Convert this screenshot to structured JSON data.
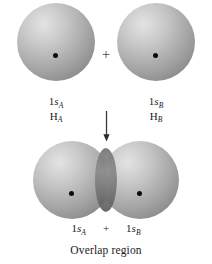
{
  "figure": {
    "background_color": "#ffffff",
    "sphere_color_light": "#e3e3e3",
    "sphere_color_dark": "#6f6f6f",
    "nucleus_color": "#0b0b0b",
    "overlap_color": "#6a6a6a"
  },
  "top_row": {
    "left_atom": {
      "orbital_prefix": "1",
      "orbital_symbol": "s",
      "orbital_subscript": "A",
      "atom_symbol": "H",
      "atom_subscript": "A",
      "nucleus_label": "nucleus"
    },
    "operator": "+",
    "right_atom": {
      "orbital_prefix": "1",
      "orbital_symbol": "s",
      "orbital_subscript": "B",
      "atom_symbol": "H",
      "atom_subscript": "B",
      "nucleus_label": "nucleus"
    }
  },
  "transition": {
    "arrow": "downward-arrow"
  },
  "bottom_row": {
    "left_orbital": {
      "orbital_prefix": "1",
      "orbital_symbol": "s",
      "orbital_subscript": "A"
    },
    "operator": "+",
    "right_orbital": {
      "orbital_prefix": "1",
      "orbital_symbol": "s",
      "orbital_subscript": "B"
    }
  },
  "caption": {
    "text": "Overlap region"
  }
}
